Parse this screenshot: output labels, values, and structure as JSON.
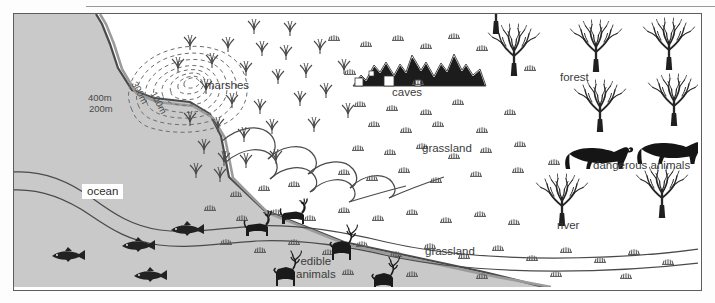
{
  "figure": {
    "kind": "illustrated-survival-map",
    "frame_border_color": "#5d5d5d",
    "ocean_fill": "#c9c9c9",
    "land_fill": "#ffffff",
    "ink_color": "#3c3c3c",
    "silhouette_color": "#1a1a1a"
  },
  "labels": {
    "ocean": "ocean",
    "marshes": "marshes",
    "caves": "caves",
    "forest": "forest",
    "grassland_upper": "grassland",
    "grassland_lower": "grassland",
    "river": "river",
    "dangerous_animals": "dangerous animals",
    "edible_animals_line1": "edible",
    "edible_animals_line2": "animals"
  },
  "contours": {
    "label_400": "400m",
    "label_300": "300m",
    "label_200": "200m",
    "label_100": "100m"
  },
  "features": {
    "fish_count": 4,
    "goat_count": 2,
    "deer_count": 3,
    "bear_count": 2,
    "tree_count": 10,
    "mountain_peaks": 3
  }
}
